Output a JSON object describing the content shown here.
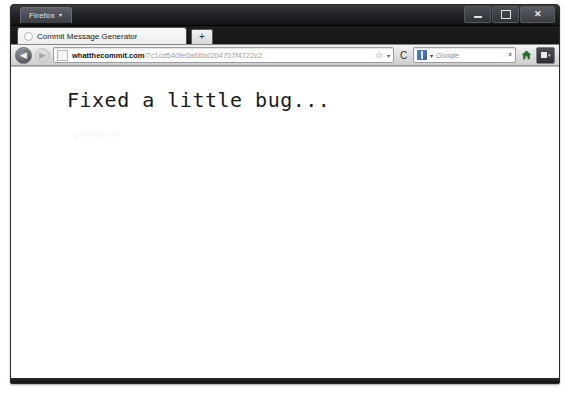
{
  "window": {
    "firefox_menu_label": "Firefox",
    "firefox_menu_caret": "▾",
    "controls": {
      "minimize_label": "—",
      "maximize_label": "▢",
      "close_label": "✕"
    }
  },
  "tabs": {
    "active": {
      "title": "Commit Message Generator"
    },
    "new_tab_label": "+"
  },
  "toolbar": {
    "back_label": "◀",
    "forward_label": "▶",
    "reload_label": "C",
    "bookmark_star_label": "☆",
    "urlbar_dropmarker_label": "▾",
    "url": {
      "host": "whatthecommit.com",
      "path": "/7c1cd540fe0a66b0204707f4722c2"
    },
    "search": {
      "placeholder": "Google",
      "caret_label": "▾",
      "go_label": "⌕"
    },
    "extension_caret_label": "▾"
  },
  "page": {
    "commit_message": "Fixed a little bug...",
    "permalink_label": "permalink"
  },
  "colors": {
    "titlebar_dark": "#141517",
    "toolbar_gray": "#dedede",
    "page_background": "#ffffff",
    "commit_text": "#1a1a1a",
    "permalink_text": "#f3f3f3"
  }
}
